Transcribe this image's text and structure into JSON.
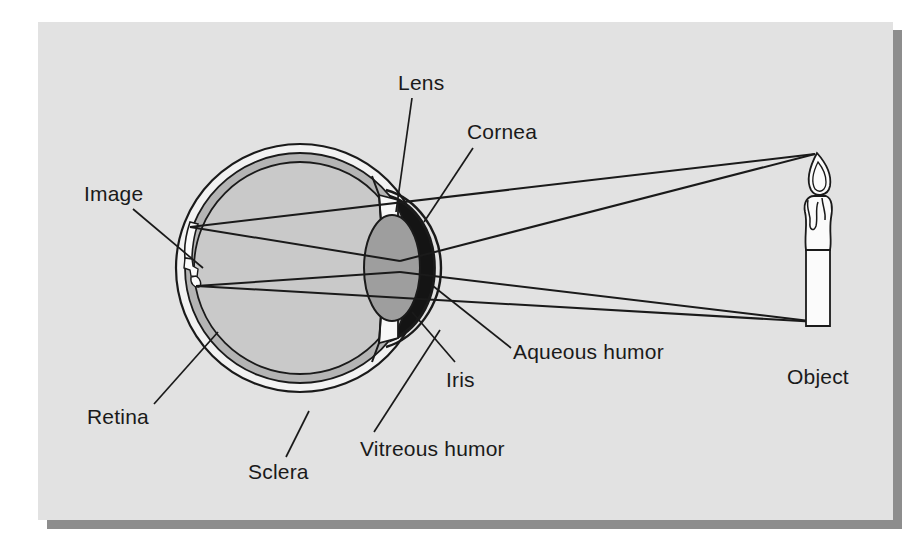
{
  "figure": {
    "panel": {
      "background_color": "#e2e2e2",
      "shadow_color": "#8a8a8a",
      "x": 38,
      "y": 22,
      "width": 855,
      "height": 498
    },
    "page_background_color": "#ffffff",
    "ink_color": "#1a1a1a"
  },
  "labels": [
    {
      "id": "lens",
      "text": "Lens",
      "x": 398,
      "y": 90,
      "anchor": "start"
    },
    {
      "id": "cornea",
      "text": "Cornea",
      "x": 467,
      "y": 139,
      "anchor": "start"
    },
    {
      "id": "image",
      "text": "Image",
      "x": 84,
      "y": 201,
      "anchor": "start"
    },
    {
      "id": "aqueous-humor",
      "text": "Aqueous humor",
      "x": 513,
      "y": 359,
      "anchor": "start"
    },
    {
      "id": "iris",
      "text": "Iris",
      "x": 446,
      "y": 387,
      "anchor": "start"
    },
    {
      "id": "object",
      "text": "Object",
      "x": 787,
      "y": 384,
      "anchor": "start"
    },
    {
      "id": "retina",
      "text": "Retina",
      "x": 87,
      "y": 424,
      "anchor": "start"
    },
    {
      "id": "vitreous-humor",
      "text": "Vitreous humor",
      "x": 360,
      "y": 456,
      "anchor": "start"
    },
    {
      "id": "sclera",
      "text": "Sclera",
      "x": 248,
      "y": 479,
      "anchor": "start"
    }
  ],
  "leader_lines": [
    {
      "id": "lens-leader",
      "from": [
        411,
        98
      ],
      "to": [
        396,
        212
      ]
    },
    {
      "id": "cornea-leader",
      "from": [
        474,
        148
      ],
      "to": [
        423,
        222
      ]
    },
    {
      "id": "image-leader",
      "from": [
        131,
        208
      ],
      "to": [
        200,
        265
      ]
    },
    {
      "id": "aqueous-leader",
      "from": [
        512,
        348
      ],
      "to": [
        434,
        285
      ]
    },
    {
      "id": "iris-leader",
      "from": [
        455,
        362
      ],
      "to": [
        414,
        310
      ]
    },
    {
      "id": "retina-leader",
      "from": [
        152,
        404
      ],
      "to": [
        216,
        332
      ]
    },
    {
      "id": "vitreous-leader",
      "from": [
        372,
        432
      ],
      "to": [
        438,
        330
      ]
    },
    {
      "id": "sclera-leader",
      "from": [
        284,
        456
      ],
      "to": [
        307,
        410
      ]
    }
  ],
  "eye_geometry": {
    "center": [
      300,
      268
    ],
    "sclera_outer_radius": 124,
    "sclera_inner_radius": 116,
    "choroid_inner_radius": 106,
    "vitreous_radius": 104,
    "sclera_fill": "#f2f2f2",
    "choroid_fill": "#b4b4b4",
    "vitreous_fill": "#c6c6c6",
    "lens_fill": "#9a9a9a",
    "aqueous_fill": "#141414",
    "iris_fill": "#f5f5f5",
    "cornea_fill": "#ededed"
  },
  "optics": {
    "object_candle": {
      "base_x": 818,
      "base_y": 325,
      "tip_x": 818,
      "tip_y": 152,
      "body_width": 26,
      "fill": "#fbfbfb"
    },
    "image_candle": {
      "base_x": 196,
      "base_y": 226,
      "tip_x": 199,
      "tip_y": 286,
      "inverted": true,
      "fill": "#fbfbfb"
    },
    "nodal_point": [
      398,
      268
    ],
    "rays": [
      {
        "id": "ray-tip-upper",
        "from": [
          815,
          154
        ],
        "to": [
          398,
          262
        ]
      },
      {
        "id": "ray-tip-lower",
        "from": [
          815,
          154
        ],
        "to": [
          196,
          230
        ]
      },
      {
        "id": "ray-base-upper",
        "from": [
          818,
          322
        ],
        "to": [
          398,
          272
        ]
      },
      {
        "id": "ray-base-lower",
        "from": [
          818,
          322
        ],
        "to": [
          199,
          283
        ]
      }
    ]
  }
}
